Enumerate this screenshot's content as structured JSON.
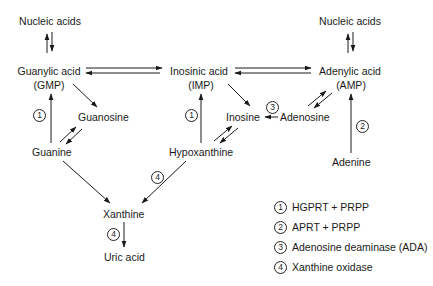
{
  "diagram": {
    "nodes": {
      "nucleic_acids_left": "Nucleic acids",
      "nucleic_acids_right": "Nucleic acids",
      "guanylic_acid": "Guanylic acid",
      "guanylic_acid_abbr": "(GMP)",
      "inosinic_acid": "Inosinic acid",
      "inosinic_acid_abbr": "(IMP)",
      "adenylic_acid": "Adenylic acid",
      "adenylic_acid_abbr": "(AMP)",
      "guanosine": "Guanosine",
      "inosine": "Inosine",
      "adenosine": "Adenosine",
      "guanine": "Guanine",
      "hypoxanthine": "Hypoxanthine",
      "adenine": "Adenine",
      "xanthine": "Xanthine",
      "uric_acid": "Uric acid"
    },
    "step_markers": {
      "guanine_to_gmp": "1",
      "hypoxanthine_to_imp": "1",
      "adenine_to_amp": "2",
      "adenosine_to_inosine": "3",
      "hypoxanthine_to_xanthine": "4",
      "xanthine_to_uric_acid": "4"
    },
    "legend": [
      {
        "num": "1",
        "text": "HGPRT + PRPP"
      },
      {
        "num": "2",
        "text": "APRT + PRPP"
      },
      {
        "num": "3",
        "text": "Adenosine deaminase (ADA)"
      },
      {
        "num": "4",
        "text": "Xanthine oxidase"
      }
    ],
    "colors": {
      "ink": "#1a1a1a",
      "background": "#ffffff"
    }
  }
}
